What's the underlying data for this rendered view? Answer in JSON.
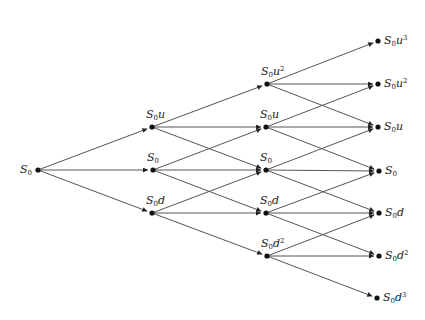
{
  "diagram": {
    "type": "trinomial-tree",
    "colors": {
      "edge": "#555555",
      "node": "#111111",
      "text": "#222222"
    },
    "nodes": [
      {
        "id": "n0_0",
        "x": 38,
        "y": 170,
        "label": "S0",
        "base": "S",
        "sub": "0",
        "var": "",
        "pow": "",
        "label_pos": "left"
      },
      {
        "id": "n1_u",
        "x": 152,
        "y": 127,
        "label": "S0u",
        "base": "S",
        "sub": "0",
        "var": "u",
        "pow": "",
        "label_pos": "above"
      },
      {
        "id": "n1_0",
        "x": 153,
        "y": 170,
        "label": "S0",
        "base": "S",
        "sub": "0",
        "var": "",
        "pow": "",
        "label_pos": "above"
      },
      {
        "id": "n1_d",
        "x": 152,
        "y": 213,
        "label": "S0d",
        "base": "S",
        "sub": "0",
        "var": "d",
        "pow": "",
        "label_pos": "above"
      },
      {
        "id": "n2_uu",
        "x": 267,
        "y": 84,
        "label": "S0u^2",
        "base": "S",
        "sub": "0",
        "var": "u",
        "pow": "2",
        "label_pos": "above"
      },
      {
        "id": "n2_u",
        "x": 266,
        "y": 127,
        "label": "S0u",
        "base": "S",
        "sub": "0",
        "var": "u",
        "pow": "",
        "label_pos": "above"
      },
      {
        "id": "n2_0",
        "x": 266,
        "y": 170,
        "label": "S0",
        "base": "S",
        "sub": "0",
        "var": "",
        "pow": "",
        "label_pos": "above"
      },
      {
        "id": "n2_d",
        "x": 266,
        "y": 213,
        "label": "S0d",
        "base": "S",
        "sub": "0",
        "var": "d",
        "pow": "",
        "label_pos": "above"
      },
      {
        "id": "n2_dd",
        "x": 267,
        "y": 256,
        "label": "S0d^2",
        "base": "S",
        "sub": "0",
        "var": "d",
        "pow": "2",
        "label_pos": "above"
      },
      {
        "id": "n3_u3",
        "x": 378,
        "y": 41,
        "label": "S0u^3",
        "base": "S",
        "sub": "0",
        "var": "u",
        "pow": "3",
        "label_pos": "right"
      },
      {
        "id": "n3_u2",
        "x": 378,
        "y": 84,
        "label": "S0u^2",
        "base": "S",
        "sub": "0",
        "var": "u",
        "pow": "2",
        "label_pos": "right"
      },
      {
        "id": "n3_u",
        "x": 378,
        "y": 127,
        "label": "S0u",
        "base": "S",
        "sub": "0",
        "var": "u",
        "pow": "",
        "label_pos": "right"
      },
      {
        "id": "n3_0",
        "x": 379,
        "y": 171,
        "label": "S0",
        "base": "S",
        "sub": "0",
        "var": "",
        "pow": "",
        "label_pos": "right"
      },
      {
        "id": "n3_d",
        "x": 379,
        "y": 213,
        "label": "S0d",
        "base": "S",
        "sub": "0",
        "var": "d",
        "pow": "",
        "label_pos": "right"
      },
      {
        "id": "n3_d2",
        "x": 379,
        "y": 256,
        "label": "S0d^2",
        "base": "S",
        "sub": "0",
        "var": "d",
        "pow": "2",
        "label_pos": "right"
      },
      {
        "id": "n3_d3",
        "x": 377,
        "y": 298,
        "label": "S0d^3",
        "base": "S",
        "sub": "0",
        "var": "d",
        "pow": "3",
        "label_pos": "right"
      }
    ],
    "edges": [
      [
        "n0_0",
        "n1_u"
      ],
      [
        "n0_0",
        "n1_0"
      ],
      [
        "n0_0",
        "n1_d"
      ],
      [
        "n1_u",
        "n2_uu"
      ],
      [
        "n1_u",
        "n2_u"
      ],
      [
        "n1_u",
        "n2_0"
      ],
      [
        "n1_0",
        "n2_u"
      ],
      [
        "n1_0",
        "n2_0"
      ],
      [
        "n1_0",
        "n2_d"
      ],
      [
        "n1_d",
        "n2_0"
      ],
      [
        "n1_d",
        "n2_d"
      ],
      [
        "n1_d",
        "n2_dd"
      ],
      [
        "n2_uu",
        "n3_u3"
      ],
      [
        "n2_uu",
        "n3_u2"
      ],
      [
        "n2_uu",
        "n3_u"
      ],
      [
        "n2_u",
        "n3_u2"
      ],
      [
        "n2_u",
        "n3_u"
      ],
      [
        "n2_u",
        "n3_0"
      ],
      [
        "n2_0",
        "n3_u"
      ],
      [
        "n2_0",
        "n3_0"
      ],
      [
        "n2_0",
        "n3_d"
      ],
      [
        "n2_d",
        "n3_0"
      ],
      [
        "n2_d",
        "n3_d"
      ],
      [
        "n2_d",
        "n3_d2"
      ],
      [
        "n2_dd",
        "n3_d"
      ],
      [
        "n2_dd",
        "n3_d2"
      ],
      [
        "n2_dd",
        "n3_d3"
      ]
    ]
  }
}
